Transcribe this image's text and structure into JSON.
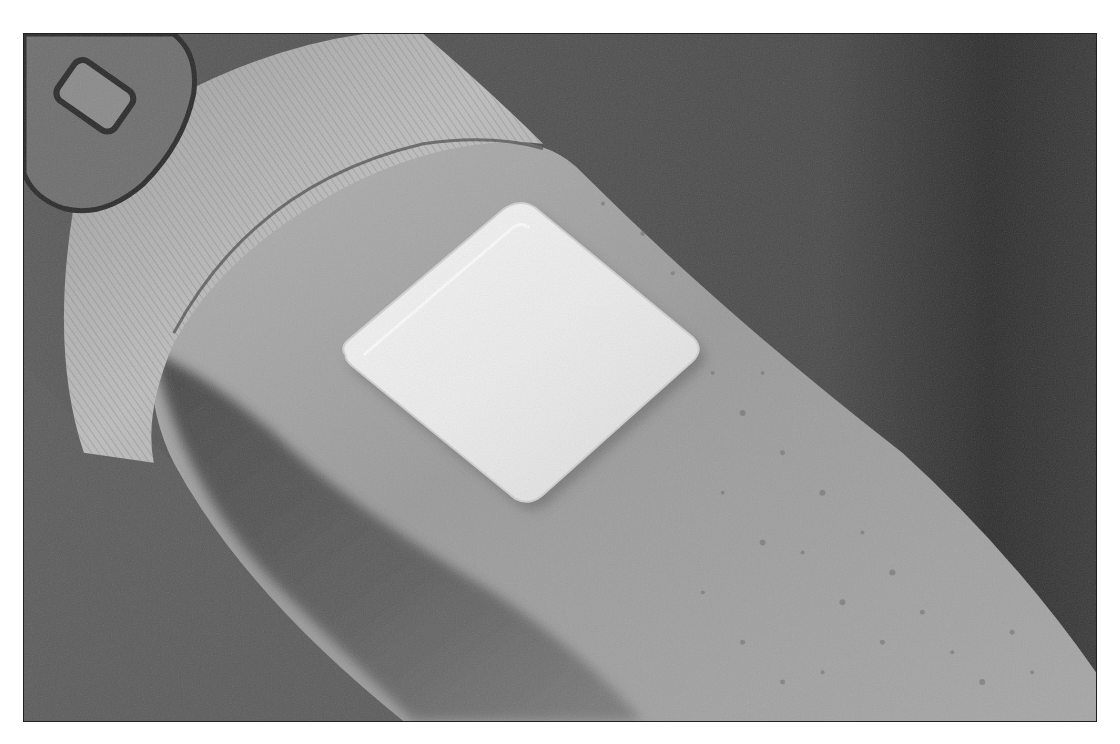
{
  "photo": {
    "subject": "Adhesive patch applied to upper arm",
    "alt": "Grayscale photograph of a white square adhesive patch on a person's upper arm, with a ribbed sleeve cuff and a device with a button at upper left",
    "elements": {
      "patch": "white-square-patch",
      "arm": "upper-arm-skin",
      "sleeve": "ribbed-sleeve-cuff",
      "device": "device-with-button",
      "background": "dark-background"
    },
    "colors": {
      "background_dark": "#3a3a3a",
      "background_mid": "#555555",
      "skin_light": "#9a9a9a",
      "skin_shadow": "#505050",
      "sleeve": "#b8b8b8",
      "patch": "#ececec",
      "device": "#6a6a6a",
      "frame_border": "#222222"
    }
  }
}
